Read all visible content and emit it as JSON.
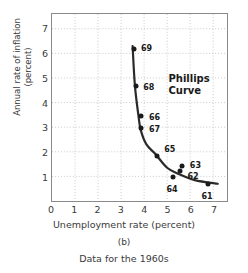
{
  "chart_data": {
    "type": "scatter",
    "title": "",
    "xlabel": "Unemployment rate (percent)",
    "ylabel_line1": "Annual rate of inflation",
    "ylabel_line2": "(percent)",
    "xlim": [
      0,
      7.6
    ],
    "ylim": [
      0,
      7.6
    ],
    "xticks": [
      0,
      1,
      2,
      3,
      4,
      5,
      6,
      7
    ],
    "yticks": [
      1,
      2,
      3,
      4,
      5,
      6,
      7
    ],
    "grid": true,
    "grid_style": "dotted",
    "grid_color": "#c9c9c9",
    "frame_color": "#8a8a8a",
    "point_color": "#1a1a1a",
    "curve_color": "#2a2a2a",
    "legend": "none",
    "annotation_line1": "Phillips",
    "annotation_line2": "Curve",
    "annotation_x": 5.0,
    "annotation_y": 4.75,
    "points": [
      {
        "label": "69",
        "x": 3.5,
        "y": 6.2,
        "label_dx": 13,
        "label_dy": -1
      },
      {
        "label": "68",
        "x": 3.6,
        "y": 4.7,
        "label_dx": 13,
        "label_dy": 1
      },
      {
        "label": "66",
        "x": 3.8,
        "y": 3.5,
        "label_dx": 14,
        "label_dy": 1
      },
      {
        "label": "67",
        "x": 3.8,
        "y": 3.0,
        "label_dx": 14,
        "label_dy": 1
      },
      {
        "label": "65",
        "x": 4.5,
        "y": 1.9,
        "label_dx": 13,
        "label_dy": -7
      },
      {
        "label": "63",
        "x": 5.6,
        "y": 1.5,
        "label_dx": 13,
        "label_dy": -1
      },
      {
        "label": "62",
        "x": 5.5,
        "y": 1.3,
        "label_dx": 13,
        "label_dy": 5
      },
      {
        "label": "64",
        "x": 5.2,
        "y": 1.05,
        "label_dx": -1,
        "label_dy": 12
      },
      {
        "label": "61",
        "x": 6.7,
        "y": 0.75,
        "label_dx": -1,
        "label_dy": 12
      }
    ],
    "curve_points": [
      {
        "x": 3.5,
        "y": 6.3
      },
      {
        "x": 3.6,
        "y": 4.7
      },
      {
        "x": 3.75,
        "y": 3.5
      },
      {
        "x": 3.85,
        "y": 2.9
      },
      {
        "x": 4.1,
        "y": 2.3
      },
      {
        "x": 4.5,
        "y": 1.9
      },
      {
        "x": 5.0,
        "y": 1.35
      },
      {
        "x": 5.5,
        "y": 1.1
      },
      {
        "x": 6.2,
        "y": 0.85
      },
      {
        "x": 7.2,
        "y": 0.7
      }
    ]
  },
  "caption": {
    "panel_letter": "(b)",
    "subcaption": "Data for the 1960s"
  }
}
